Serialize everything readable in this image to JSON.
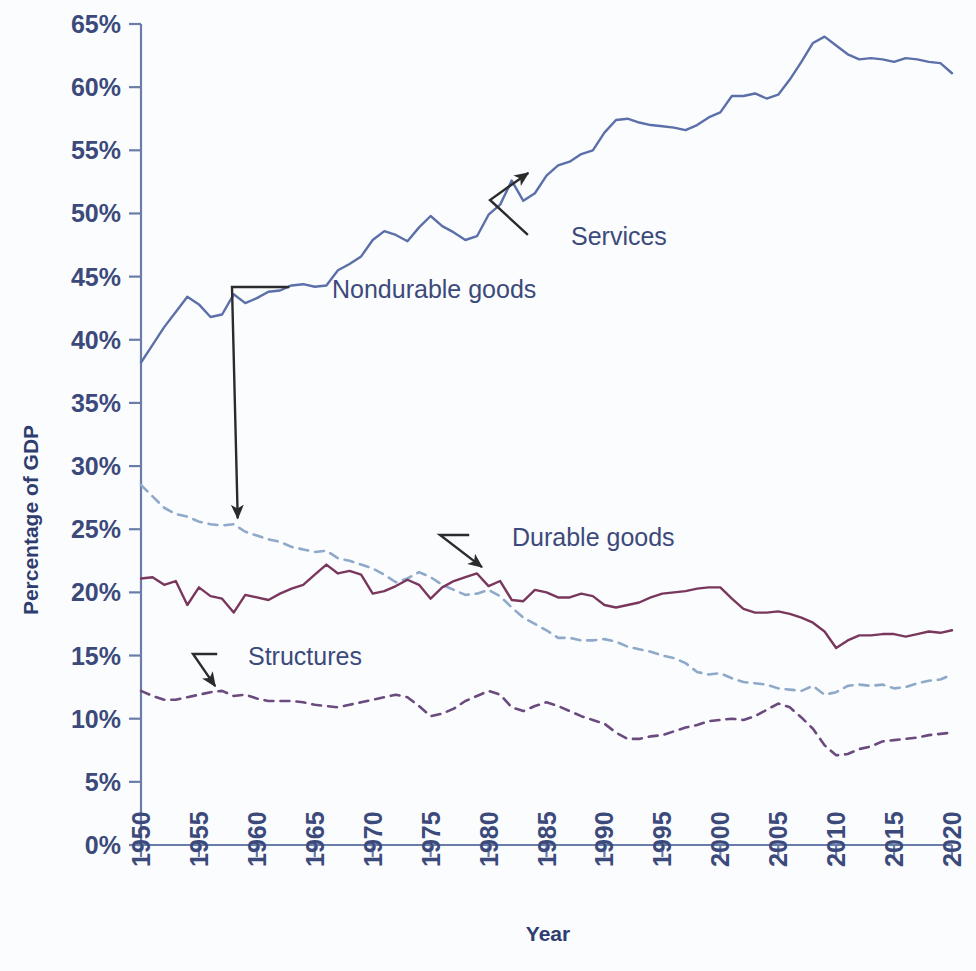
{
  "chart_data": {
    "type": "line",
    "title": "",
    "xlabel": "Year",
    "ylabel": "Percentage of GDP",
    "xlim": [
      1950,
      2020
    ],
    "ylim": [
      0,
      65
    ],
    "grid": false,
    "legend_position": "inline-annotations",
    "ytick_labels": [
      "0%",
      "5%",
      "10%",
      "15%",
      "20%",
      "25%",
      "30%",
      "35%",
      "40%",
      "45%",
      "50%",
      "55%",
      "60%",
      "65%"
    ],
    "ytick_values": [
      0,
      5,
      10,
      15,
      20,
      25,
      30,
      35,
      40,
      45,
      50,
      55,
      60,
      65
    ],
    "xtick_labels": [
      "1950",
      "1955",
      "1960",
      "1965",
      "1970",
      "1975",
      "1980",
      "1985",
      "1990",
      "1995",
      "2000",
      "2005",
      "2010",
      "2015",
      "2020"
    ],
    "xtick_values": [
      1950,
      1955,
      1960,
      1965,
      1970,
      1975,
      1980,
      1985,
      1990,
      1995,
      2000,
      2005,
      2010,
      2015,
      2020
    ],
    "x": [
      1950,
      1951,
      1952,
      1953,
      1954,
      1955,
      1956,
      1957,
      1958,
      1959,
      1960,
      1961,
      1962,
      1963,
      1964,
      1965,
      1966,
      1967,
      1968,
      1969,
      1970,
      1971,
      1972,
      1973,
      1974,
      1975,
      1976,
      1977,
      1978,
      1979,
      1980,
      1981,
      1982,
      1983,
      1984,
      1985,
      1986,
      1987,
      1988,
      1989,
      1990,
      1991,
      1992,
      1993,
      1994,
      1995,
      1996,
      1997,
      1998,
      1999,
      2000,
      2001,
      2002,
      2003,
      2004,
      2005,
      2006,
      2007,
      2008,
      2009,
      2010,
      2011,
      2012,
      2013,
      2014,
      2015,
      2016,
      2017,
      2018,
      2019,
      2020
    ],
    "series": [
      {
        "name": "Services",
        "style": "solid",
        "color": "#5b6fa8",
        "values": [
          38.2,
          39.6,
          41.0,
          42.2,
          43.4,
          42.8,
          41.8,
          42.0,
          43.6,
          42.9,
          43.3,
          43.8,
          43.9,
          44.3,
          44.4,
          44.2,
          44.3,
          45.5,
          46.0,
          46.6,
          47.9,
          48.6,
          48.3,
          47.8,
          48.9,
          49.8,
          49.0,
          48.5,
          47.9,
          48.2,
          49.9,
          50.7,
          52.6,
          51.0,
          51.6,
          53.0,
          53.8,
          54.1,
          54.7,
          55.0,
          56.4,
          57.4,
          57.5,
          57.2,
          57.0,
          56.9,
          56.8,
          56.6,
          57.0,
          57.6,
          58.0,
          59.3,
          59.3,
          59.5,
          59.1,
          59.4,
          60.6,
          62.0,
          63.5,
          64.0,
          63.3,
          62.6,
          62.2,
          62.3,
          62.2,
          62.0,
          62.3,
          62.2,
          62.0,
          61.9,
          61.1
        ]
      },
      {
        "name": "Nondurable goods",
        "style": "dashed",
        "color": "#8fa9c9",
        "values": [
          28.5,
          27.6,
          26.7,
          26.2,
          26.0,
          25.6,
          25.4,
          25.3,
          25.4,
          24.8,
          24.5,
          24.2,
          24.0,
          23.6,
          23.4,
          23.2,
          23.3,
          22.7,
          22.5,
          22.2,
          21.9,
          21.4,
          20.8,
          21.1,
          21.6,
          21.2,
          20.6,
          20.2,
          19.8,
          19.9,
          20.2,
          19.7,
          18.8,
          18.0,
          17.5,
          17.0,
          16.4,
          16.4,
          16.2,
          16.2,
          16.3,
          16.1,
          15.7,
          15.5,
          15.3,
          15.0,
          14.8,
          14.4,
          13.7,
          13.5,
          13.6,
          13.2,
          12.9,
          12.8,
          12.7,
          12.4,
          12.3,
          12.2,
          12.6,
          11.9,
          12.1,
          12.6,
          12.7,
          12.6,
          12.7,
          12.4,
          12.5,
          12.8,
          13.0,
          13.1,
          13.5
        ]
      },
      {
        "name": "Durable goods",
        "style": "solid",
        "color": "#79375c",
        "values": [
          21.1,
          21.2,
          20.6,
          20.9,
          19.0,
          20.4,
          19.7,
          19.5,
          18.4,
          19.8,
          19.6,
          19.4,
          19.9,
          20.3,
          20.6,
          21.4,
          22.2,
          21.5,
          21.7,
          21.4,
          19.9,
          20.1,
          20.5,
          21.0,
          20.6,
          19.5,
          20.4,
          20.9,
          21.2,
          21.5,
          20.5,
          20.9,
          19.4,
          19.3,
          20.2,
          20.0,
          19.6,
          19.6,
          19.9,
          19.7,
          19.0,
          18.8,
          19.0,
          19.2,
          19.6,
          19.9,
          20.0,
          20.1,
          20.3,
          20.4,
          20.4,
          19.5,
          18.7,
          18.4,
          18.4,
          18.5,
          18.3,
          18.0,
          17.6,
          16.9,
          15.6,
          16.2,
          16.6,
          16.6,
          16.7,
          16.7,
          16.5,
          16.7,
          16.9,
          16.8,
          17.0
        ]
      },
      {
        "name": "Structures",
        "style": "dashed",
        "color": "#6b4a7d",
        "values": [
          12.2,
          11.8,
          11.5,
          11.5,
          11.7,
          11.9,
          12.1,
          12.2,
          11.8,
          11.9,
          11.6,
          11.4,
          11.4,
          11.4,
          11.3,
          11.1,
          11.0,
          10.9,
          11.1,
          11.3,
          11.5,
          11.7,
          11.9,
          11.7,
          11.0,
          10.2,
          10.4,
          10.8,
          11.4,
          11.8,
          12.2,
          11.9,
          10.9,
          10.6,
          11.0,
          11.3,
          11.0,
          10.6,
          10.2,
          9.9,
          9.6,
          8.9,
          8.4,
          8.4,
          8.6,
          8.7,
          9.0,
          9.3,
          9.5,
          9.8,
          9.9,
          10.0,
          9.9,
          10.2,
          10.7,
          11.2,
          10.9,
          10.1,
          9.2,
          7.9,
          7.1,
          7.2,
          7.6,
          7.8,
          8.2,
          8.3,
          8.4,
          8.5,
          8.7,
          8.8,
          8.9
        ]
      }
    ],
    "annotations": [
      {
        "label": "Services",
        "series": "Services",
        "target_x": 1983,
        "target_y": 52.6
      },
      {
        "label": "Nondurable goods",
        "series": "Nondurable goods",
        "target_x": 1958,
        "target_y": 25.4
      },
      {
        "label": "Durable goods",
        "series": "Durable goods",
        "target_x": 1979,
        "target_y": 21.5
      },
      {
        "label": "Structures",
        "series": "Structures",
        "target_x": 1956,
        "target_y": 12.1
      }
    ]
  },
  "axes": {
    "y_title": "Percentage of GDP",
    "x_title": "Year"
  },
  "colors": {
    "axis": "#6a7da8",
    "tick_text": "#3b4a7a",
    "title_text": "#2e3d6e",
    "leader": "#2b2b2b",
    "background": "#fbfcfe"
  }
}
